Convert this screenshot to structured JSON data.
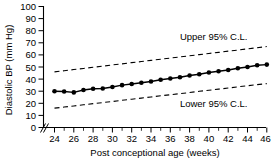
{
  "chart_data": {
    "type": "line",
    "title": "",
    "subtitle": "",
    "xlabel": "Post conceptional age (weeks)",
    "ylabel": "Diastolic BP (mm Hg)",
    "xlim": [
      23,
      46.6
    ],
    "ylim": [
      0,
      100
    ],
    "grid": false,
    "legend_position": "none",
    "axis_break": {
      "axis": "both",
      "symbol": "//",
      "note": "slash break drawn at origin"
    },
    "x_ticks_major": [
      24,
      26,
      28,
      30,
      32,
      34,
      36,
      38,
      40,
      42,
      44,
      46
    ],
    "x_tick_labels": [
      "24",
      "26",
      "28",
      "30",
      "32",
      "34",
      "36",
      "38",
      "40",
      "42",
      "44",
      "46"
    ],
    "x_ticks_minor": [
      25,
      27,
      29,
      31,
      33,
      35,
      37,
      39,
      41,
      43,
      45
    ],
    "y_ticks": [
      0,
      10,
      20,
      30,
      40,
      50,
      60,
      70,
      80,
      90,
      100
    ],
    "y_tick_labels": [
      "0",
      "10",
      "20",
      "30",
      "40",
      "50",
      "60",
      "70",
      "80",
      "90",
      "100"
    ],
    "x": [
      24,
      25,
      26,
      27,
      28,
      29,
      30,
      31,
      32,
      33,
      34,
      35,
      36,
      37,
      38,
      39,
      40,
      41,
      42,
      43,
      44,
      45,
      46
    ],
    "series": [
      {
        "name": "Mean diastolic BP",
        "style": "solid-line-with-markers",
        "marker": "filled-circle",
        "color": "#000000",
        "values": [
          30.0,
          29.8,
          29.0,
          31.0,
          32.0,
          32.2,
          33.5,
          35.0,
          36.0,
          37.0,
          38.0,
          39.5,
          40.5,
          41.5,
          43.0,
          44.0,
          45.5,
          46.5,
          47.5,
          49.0,
          50.0,
          51.5,
          52.0
        ]
      },
      {
        "name": "Upper 95% C.L.",
        "style": "dashed-line",
        "marker": "none",
        "color": "#000000",
        "values": [
          46.0,
          46.9,
          47.9,
          48.8,
          49.8,
          50.7,
          51.7,
          52.6,
          53.6,
          54.5,
          55.5,
          56.4,
          57.4,
          58.3,
          59.3,
          60.2,
          61.2,
          62.1,
          63.1,
          64.0,
          65.0,
          65.9,
          66.9
        ]
      },
      {
        "name": "Lower 95% C.L.",
        "style": "dashed-line",
        "marker": "none",
        "color": "#000000",
        "values": [
          16.0,
          16.9,
          17.8,
          18.8,
          19.7,
          20.6,
          21.5,
          22.5,
          23.4,
          24.3,
          25.2,
          26.2,
          27.1,
          28.0,
          28.9,
          29.9,
          30.8,
          31.7,
          32.6,
          33.6,
          34.5,
          35.4,
          36.3
        ]
      }
    ],
    "annotations": [
      {
        "name": "upper-cl-label",
        "text": "Upper 95% C.L.",
        "x": 40.5,
        "y": 72
      },
      {
        "name": "lower-cl-label",
        "text": "Lower 95% C.L.",
        "x": 40.5,
        "y": 17
      }
    ]
  }
}
